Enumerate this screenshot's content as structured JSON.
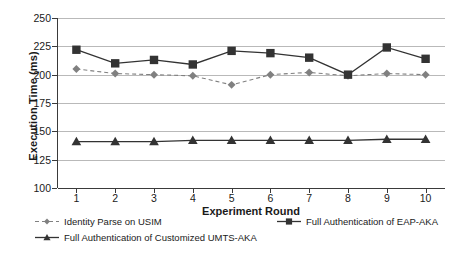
{
  "chart_data": {
    "type": "line",
    "title": "",
    "xlabel": "Experiment Round",
    "ylabel": "Execution Time (ms)",
    "x": [
      1,
      2,
      3,
      4,
      5,
      6,
      7,
      8,
      9,
      10
    ],
    "xtick_labels": [
      "1",
      "2",
      "3",
      "4",
      "5",
      "6",
      "7",
      "8",
      "9",
      "10"
    ],
    "ytick_labels": [
      "250",
      "225",
      "200",
      "175",
      "150",
      "125",
      "100"
    ],
    "yticks": [
      250,
      225,
      200,
      175,
      150,
      125,
      100
    ],
    "ylim": [
      100,
      250
    ],
    "xlim": [
      0.5,
      10.5
    ],
    "grid": "horizontal",
    "legend_position": "bottom",
    "series": [
      {
        "name": "Identity Parse on USIM",
        "marker": "diamond",
        "linestyle": "dashed",
        "color": "#808080",
        "values": [
          205,
          201,
          200,
          199,
          191,
          200,
          202,
          199,
          201,
          200
        ]
      },
      {
        "name": "Full Authentication of EAP-AKA",
        "marker": "square",
        "linestyle": "solid",
        "color": "#333333",
        "values": [
          222,
          210,
          213,
          209,
          221,
          219,
          215,
          200,
          224,
          214
        ]
      },
      {
        "name": "Full Authentication of Customized UMTS-AKA",
        "marker": "triangle",
        "linestyle": "solid",
        "color": "#333333",
        "values": [
          141,
          141,
          141,
          142,
          142,
          142,
          142,
          142,
          143,
          143
        ]
      }
    ]
  }
}
